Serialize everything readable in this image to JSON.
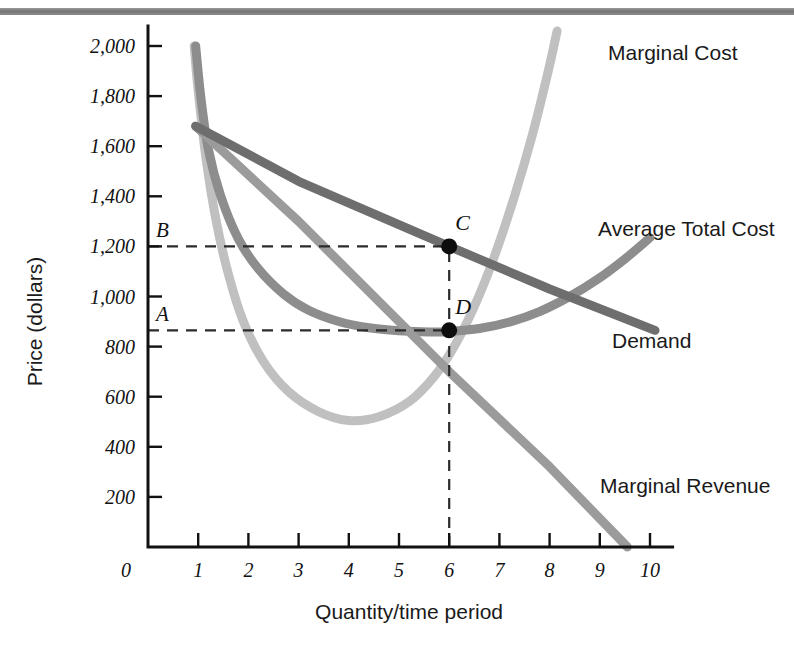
{
  "figure": {
    "name": "monopolistic-competition-long-run-graph",
    "background_color": "#ffffff",
    "top_rule_color": "#7d7d7d"
  },
  "chart_data": {
    "type": "line",
    "title": "",
    "xlabel": "Quantity/time period",
    "ylabel": "Price (dollars)",
    "xlim": [
      0,
      10.6
    ],
    "ylim": [
      0,
      2100
    ],
    "grid": false,
    "legend_position": "inline-right",
    "x_ticks": [
      0,
      1,
      2,
      3,
      4,
      5,
      6,
      7,
      8,
      9,
      10
    ],
    "x_tick_labels": [
      "0",
      "1",
      "2",
      "3",
      "4",
      "5",
      "6",
      "7",
      "8",
      "9",
      "10"
    ],
    "y_ticks": [
      200,
      400,
      600,
      800,
      1000,
      1200,
      1400,
      1600,
      1800,
      2000
    ],
    "y_tick_labels": [
      "200",
      "400",
      "600",
      "800",
      "1,000",
      "1,200",
      "1,400",
      "1,600",
      "1,800",
      "2,000"
    ],
    "series": [
      {
        "name": "Marginal Cost",
        "label": "Marginal Cost",
        "color": "#c0c0c0",
        "width": 9,
        "points": [
          [
            0.92,
            2000
          ],
          [
            1.0,
            1820
          ],
          [
            1.15,
            1560
          ],
          [
            1.35,
            1310
          ],
          [
            1.6,
            1090
          ],
          [
            1.9,
            900
          ],
          [
            2.3,
            740
          ],
          [
            2.8,
            620
          ],
          [
            3.4,
            540
          ],
          [
            4.0,
            505
          ],
          [
            4.6,
            520
          ],
          [
            5.2,
            580
          ],
          [
            5.7,
            680
          ],
          [
            6.1,
            800
          ],
          [
            6.5,
            960
          ],
          [
            6.9,
            1160
          ],
          [
            7.3,
            1400
          ],
          [
            7.65,
            1640
          ],
          [
            7.95,
            1880
          ],
          [
            8.15,
            2060
          ]
        ]
      },
      {
        "name": "Average Total Cost",
        "label": "Average Total Cost",
        "color": "#8d8d8d",
        "width": 9,
        "points": [
          [
            0.95,
            2000
          ],
          [
            1.05,
            1800
          ],
          [
            1.2,
            1590
          ],
          [
            1.45,
            1400
          ],
          [
            1.8,
            1230
          ],
          [
            2.2,
            1110
          ],
          [
            2.7,
            1010
          ],
          [
            3.2,
            945
          ],
          [
            3.8,
            900
          ],
          [
            4.4,
            875
          ],
          [
            5.0,
            863
          ],
          [
            5.6,
            858
          ],
          [
            6.0,
            860
          ],
          [
            6.6,
            872
          ],
          [
            7.2,
            898
          ],
          [
            7.8,
            940
          ],
          [
            8.4,
            1000
          ],
          [
            9.0,
            1075
          ],
          [
            9.5,
            1150
          ],
          [
            10.0,
            1235
          ]
        ]
      },
      {
        "name": "Demand",
        "label": "Demand",
        "color": "#6e6e6e",
        "width": 9,
        "points": [
          [
            0.95,
            1680
          ],
          [
            3.0,
            1460
          ],
          [
            6.0,
            1200
          ],
          [
            8.0,
            1030
          ],
          [
            10.1,
            865
          ]
        ]
      },
      {
        "name": "Marginal Revenue",
        "label": "Marginal Revenue",
        "color": "#9b9b9b",
        "width": 9,
        "points": [
          [
            0.95,
            1680
          ],
          [
            3.0,
            1300
          ],
          [
            6.0,
            700
          ],
          [
            8.0,
            320
          ],
          [
            9.55,
            0
          ]
        ]
      }
    ],
    "annotated_points": [
      {
        "id": "C",
        "label": "C",
        "x": 6,
        "y": 1200,
        "on_curve": "Demand"
      },
      {
        "id": "D",
        "label": "D",
        "x": 6,
        "y": 865,
        "on_curve": "Average Total Cost"
      }
    ],
    "reference_lines": [
      {
        "id": "B",
        "label": "B",
        "axis": "y",
        "value": 1200,
        "from_x": 0,
        "to_x": 6,
        "style": "dashed"
      },
      {
        "id": "A",
        "label": "A",
        "axis": "y",
        "value": 865,
        "from_x": 0,
        "to_x": 6,
        "style": "dashed"
      },
      {
        "id": "Q",
        "label": "",
        "axis": "x",
        "value": 6,
        "from_y": 0,
        "to_y": 1200,
        "style": "dashed"
      }
    ]
  }
}
